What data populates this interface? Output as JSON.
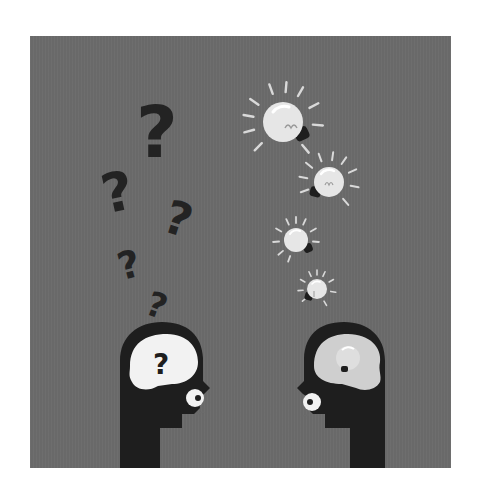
{
  "illustration": {
    "subject": "Two heads facing each other: one confused with question marks, one with light-bulb ideas",
    "colors": {
      "background_page": "#ffffff",
      "panel": "#6b6b6b",
      "silhouette": "#1e1e1e",
      "question_mark": "#232323",
      "brain_left": "#f2f2f2",
      "brain_right": "#cfcfcf",
      "bulb_glass": "#e6e6e6",
      "bulb_base": "#1e1e1e",
      "rays": "#d9d9d9"
    },
    "left_head": {
      "label": "confused-head",
      "brain_symbol": "?"
    },
    "right_head": {
      "label": "idea-head",
      "brain_symbol": "bulb"
    },
    "question_marks": [
      {
        "symbol": "?",
        "x": 110,
        "y": 62,
        "size": 68,
        "rotate": 0
      },
      {
        "symbol": "?",
        "x": 72,
        "y": 128,
        "size": 52,
        "rotate": -12
      },
      {
        "symbol": "?",
        "x": 135,
        "y": 160,
        "size": 46,
        "rotate": 18
      },
      {
        "symbol": "?",
        "x": 88,
        "y": 210,
        "size": 38,
        "rotate": -15
      },
      {
        "symbol": "?",
        "x": 118,
        "y": 250,
        "size": 34,
        "rotate": 20
      }
    ],
    "bulbs": [
      {
        "cx": 253,
        "cy": 86,
        "r": 20,
        "rays": 11,
        "ray_radius": 40
      },
      {
        "cx": 299,
        "cy": 146,
        "r": 15,
        "rays": 10,
        "ray_radius": 30
      },
      {
        "cx": 266,
        "cy": 204,
        "r": 12,
        "rays": 10,
        "ray_radius": 23
      },
      {
        "cx": 287,
        "cy": 253,
        "r": 10,
        "rays": 9,
        "ray_radius": 19
      }
    ]
  }
}
